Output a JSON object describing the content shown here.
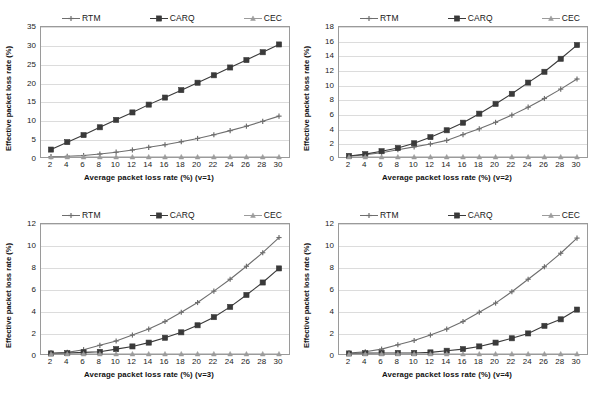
{
  "page": {
    "top_fragment": "",
    "background": "#ffffff"
  },
  "legend": {
    "items": [
      {
        "label": "RTM",
        "marker": "cross-marker",
        "color": "#6e6e6e"
      },
      {
        "label": "CARQ",
        "marker": "square-marker",
        "color": "#3a3a3a"
      },
      {
        "label": "CEC",
        "marker": "triangle-marker",
        "color": "#9b9b9b"
      }
    ]
  },
  "axis": {
    "ylabel": "Effective packet loss rate (%)"
  },
  "chart_data": [
    {
      "type": "line",
      "title": "",
      "xlabel": "Average packet loss rate (%) (v=1)",
      "ylabel": "Effective packet loss rate (%)",
      "x": [
        2,
        4,
        6,
        8,
        10,
        12,
        14,
        16,
        18,
        20,
        22,
        24,
        26,
        28,
        30
      ],
      "xlim": [
        2,
        30
      ],
      "ylim": [
        0,
        35
      ],
      "yticks": [
        0,
        5,
        10,
        15,
        20,
        25,
        30,
        35
      ],
      "xticks": [
        2,
        4,
        6,
        8,
        10,
        12,
        14,
        16,
        18,
        20,
        22,
        24,
        26,
        28,
        30
      ],
      "grid": true,
      "legend_position": "top",
      "series": [
        {
          "name": "RTM",
          "color": "#6e6e6e",
          "marker": "cross",
          "values": [
            0.1,
            0.2,
            0.4,
            0.8,
            1.3,
            1.9,
            2.6,
            3.3,
            4.1,
            5.0,
            6.0,
            7.1,
            8.3,
            9.6,
            11.0
          ]
        },
        {
          "name": "CARQ",
          "color": "#3a3a3a",
          "marker": "square",
          "values": [
            2.0,
            4.0,
            5.9,
            8.0,
            10.0,
            12.0,
            14.1,
            16.0,
            18.0,
            20.0,
            22.0,
            24.1,
            26.1,
            28.2,
            30.3
          ]
        },
        {
          "name": "CEC",
          "color": "#9b9b9b",
          "marker": "triangle",
          "values": [
            0,
            0,
            0,
            0,
            0,
            0,
            0,
            0,
            0,
            0,
            0,
            0,
            0,
            0,
            0
          ]
        }
      ]
    },
    {
      "type": "line",
      "title": "",
      "xlabel": "Average packet loss rate (%) (v=2)",
      "ylabel": "Effective packet loss rate (%)",
      "x": [
        2,
        4,
        6,
        8,
        10,
        12,
        14,
        16,
        18,
        20,
        22,
        24,
        26,
        28,
        30
      ],
      "xlim": [
        2,
        30
      ],
      "ylim": [
        0,
        18
      ],
      "yticks": [
        0,
        2,
        4,
        6,
        8,
        10,
        12,
        14,
        16,
        18
      ],
      "xticks": [
        2,
        4,
        6,
        8,
        10,
        12,
        14,
        16,
        18,
        20,
        22,
        24,
        26,
        28,
        30
      ],
      "grid": true,
      "legend_position": "top",
      "series": [
        {
          "name": "RTM",
          "color": "#6e6e6e",
          "marker": "cross",
          "values": [
            0.1,
            0.3,
            0.6,
            1.0,
            1.4,
            1.8,
            2.3,
            3.1,
            3.9,
            4.8,
            5.8,
            6.9,
            8.1,
            9.4,
            10.8
          ]
        },
        {
          "name": "CARQ",
          "color": "#3a3a3a",
          "marker": "square",
          "values": [
            0.15,
            0.4,
            0.8,
            1.25,
            1.9,
            2.75,
            3.7,
            4.75,
            6.0,
            7.35,
            8.75,
            10.3,
            11.8,
            13.6,
            15.5
          ]
        },
        {
          "name": "CEC",
          "color": "#9b9b9b",
          "marker": "triangle",
          "values": [
            0,
            0,
            0,
            0,
            0,
            0,
            0,
            0,
            0,
            0,
            0,
            0,
            0,
            0,
            0
          ]
        }
      ]
    },
    {
      "type": "line",
      "title": "",
      "xlabel": "Average packet loss rate (%) (v=3)",
      "ylabel": "Effective packet loss rate (%)",
      "x": [
        2,
        4,
        6,
        8,
        10,
        12,
        14,
        16,
        18,
        20,
        22,
        24,
        26,
        28,
        30
      ],
      "xlim": [
        2,
        30
      ],
      "ylim": [
        0,
        12
      ],
      "yticks": [
        0,
        2,
        4,
        6,
        8,
        10,
        12
      ],
      "xticks": [
        2,
        4,
        6,
        8,
        10,
        12,
        14,
        16,
        18,
        20,
        22,
        24,
        26,
        28,
        30
      ],
      "grid": true,
      "legend_position": "top",
      "series": [
        {
          "name": "RTM",
          "color": "#6e6e6e",
          "marker": "cross",
          "values": [
            0.1,
            0.15,
            0.4,
            0.8,
            1.2,
            1.75,
            2.3,
            3.0,
            3.85,
            4.75,
            5.8,
            6.9,
            8.1,
            9.35,
            10.75
          ]
        },
        {
          "name": "CARQ",
          "color": "#3a3a3a",
          "marker": "square",
          "values": [
            0.05,
            0.08,
            0.15,
            0.2,
            0.45,
            0.7,
            1.05,
            1.5,
            2.0,
            2.65,
            3.4,
            4.35,
            5.45,
            6.6,
            7.9
          ]
        },
        {
          "name": "CEC",
          "color": "#9b9b9b",
          "marker": "triangle",
          "values": [
            0,
            0,
            0,
            0,
            0,
            0,
            0,
            0,
            0,
            0,
            0,
            0,
            0,
            0,
            0
          ]
        }
      ]
    },
    {
      "type": "line",
      "title": "",
      "xlabel": "Average packet loss rate (%) (v=4)",
      "ylabel": "Effective packet loss rate (%)",
      "x": [
        2,
        4,
        6,
        8,
        10,
        12,
        14,
        16,
        18,
        20,
        22,
        24,
        26,
        28,
        30
      ],
      "xlim": [
        2,
        30
      ],
      "ylim": [
        0,
        12
      ],
      "yticks": [
        0,
        2,
        4,
        6,
        8,
        10,
        12
      ],
      "xticks": [
        2,
        4,
        6,
        8,
        10,
        12,
        14,
        16,
        18,
        20,
        22,
        24,
        26,
        28,
        30
      ],
      "grid": true,
      "legend_position": "top",
      "series": [
        {
          "name": "RTM",
          "color": "#6e6e6e",
          "marker": "cross",
          "values": [
            0.1,
            0.2,
            0.45,
            0.85,
            1.25,
            1.75,
            2.3,
            3.0,
            3.85,
            4.7,
            5.75,
            6.9,
            8.05,
            9.3,
            10.7
          ]
        },
        {
          "name": "CARQ",
          "color": "#3a3a3a",
          "marker": "square",
          "values": [
            0.05,
            0.08,
            0.1,
            0.1,
            0.1,
            0.15,
            0.3,
            0.45,
            0.7,
            1.05,
            1.45,
            1.9,
            2.6,
            3.2,
            4.1
          ]
        },
        {
          "name": "CEC",
          "color": "#9b9b9b",
          "marker": "triangle",
          "values": [
            0,
            0,
            0,
            0,
            0,
            0,
            0,
            0,
            0,
            0,
            0,
            0,
            0,
            0,
            0
          ]
        }
      ]
    }
  ]
}
